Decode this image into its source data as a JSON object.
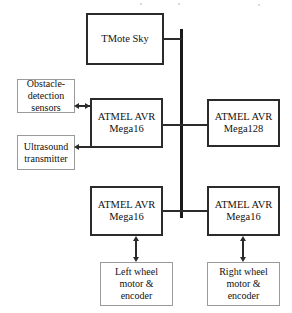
{
  "diagram": {
    "colors": {
      "mcu_border": "#2b2b2b",
      "peripheral_border": "#9a9a9a",
      "bus": "#1a1a1a",
      "background": "#ffffff",
      "text": "#111111"
    },
    "nodes": {
      "tmote": {
        "label": "TMote Sky",
        "kind": "mcu"
      },
      "obstacle_sensors": {
        "label": "Obstacle-\ndetection\nsensors",
        "kind": "peripheral"
      },
      "ultrasound": {
        "label": "Ultrasound\ntransmitter",
        "kind": "peripheral"
      },
      "mega16_sensor": {
        "label": "ATMEL AVR\nMega16",
        "kind": "mcu"
      },
      "mega128": {
        "label": "ATMEL AVR\nMega128",
        "kind": "mcu"
      },
      "mega16_left": {
        "label": "ATMEL AVR\nMega16",
        "kind": "mcu"
      },
      "mega16_right": {
        "label": "ATMEL AVR\nMega16",
        "kind": "mcu"
      },
      "left_wheel": {
        "label": "Left wheel\nmotor &\nencoder",
        "kind": "peripheral"
      },
      "right_wheel": {
        "label": "Right wheel\nmotor &\nencoder",
        "kind": "peripheral"
      }
    },
    "connections": [
      {
        "name": "tmote-to-bus",
        "from": "tmote",
        "to": "bus",
        "arrows": "none"
      },
      {
        "name": "sensor-mcu-to-bus",
        "from": "mega16_sensor",
        "to": "bus",
        "arrows": "none"
      },
      {
        "name": "bus-to-mega128",
        "from": "bus",
        "to": "mega128",
        "arrows": "none"
      },
      {
        "name": "left-mcu-to-bus",
        "from": "mega16_left",
        "to": "bus",
        "arrows": "none"
      },
      {
        "name": "bus-to-right-mcu",
        "from": "bus",
        "to": "mega16_right",
        "arrows": "none"
      },
      {
        "name": "obstacle-sensors-link",
        "from": "obstacle_sensors",
        "to": "mega16_sensor",
        "arrows": "both"
      },
      {
        "name": "ultrasound-link",
        "from": "mega16_sensor",
        "to": "ultrasound",
        "arrows": "to-target"
      },
      {
        "name": "left-wheel-link",
        "from": "mega16_left",
        "to": "left_wheel",
        "arrows": "both"
      },
      {
        "name": "right-wheel-link",
        "from": "mega16_right",
        "to": "right_wheel",
        "arrows": "both"
      }
    ]
  }
}
